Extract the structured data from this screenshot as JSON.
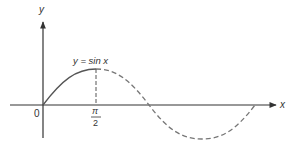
{
  "diagram": {
    "type": "function-plot",
    "function_label": "y = sin x",
    "axes": {
      "x_label": "x",
      "y_label": "y",
      "origin_label": "0"
    },
    "ticks": [
      {
        "numerator": "π",
        "denominator": "2"
      }
    ],
    "segments": [
      {
        "name": "solid",
        "from": "0",
        "to": "π/2"
      },
      {
        "name": "dashed",
        "from": "π/2",
        "to": "2π"
      }
    ],
    "colors": {
      "axis": "#333333",
      "curve": "#666666",
      "background": "#ffffff"
    }
  }
}
